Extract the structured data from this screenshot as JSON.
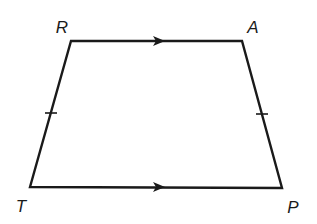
{
  "diagram": {
    "type": "trapezoid",
    "stroke_color": "#1a1a1a",
    "vertices": [
      {
        "label": "R",
        "x": 71,
        "y": 41,
        "label_x": 62,
        "label_y": 27
      },
      {
        "label": "A",
        "x": 242,
        "y": 41,
        "label_x": 253,
        "label_y": 27
      },
      {
        "label": "P",
        "x": 282,
        "y": 188,
        "label_x": 293,
        "label_y": 207
      },
      {
        "label": "T",
        "x": 30,
        "y": 187,
        "label_x": 21,
        "label_y": 206
      }
    ],
    "parallel_marks": [
      {
        "segment": "RA",
        "arrow_tip": {
          "x": 161,
          "y": 41
        }
      },
      {
        "segment": "TP",
        "arrow_tip": {
          "x": 161,
          "y": 187
        }
      }
    ],
    "congruence_marks": [
      {
        "segment": "RT",
        "x": 51,
        "y": 113
      },
      {
        "segment": "AP",
        "x": 262,
        "y": 114
      }
    ]
  }
}
